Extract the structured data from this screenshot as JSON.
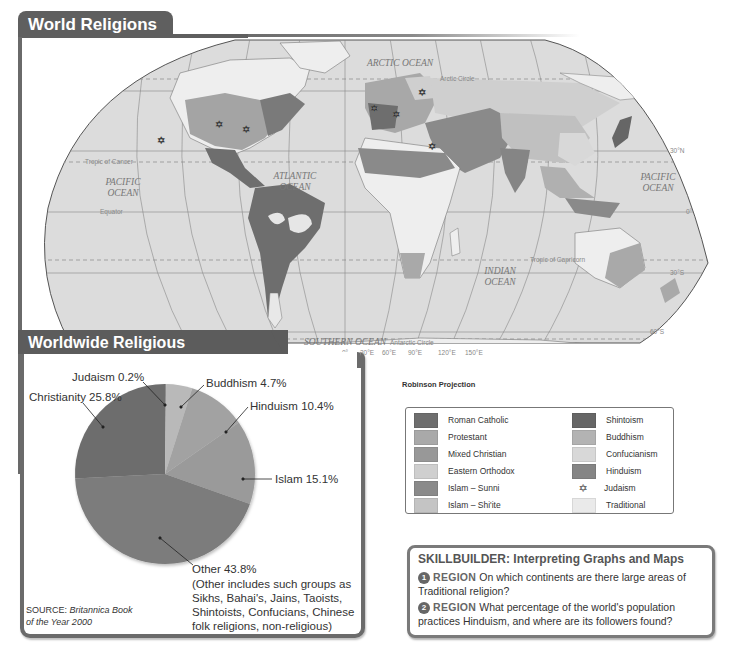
{
  "map": {
    "title": "World Religions",
    "projection": "Robinson Projection",
    "oceans": [
      "ARCTIC OCEAN",
      "PACIFIC OCEAN",
      "ATLANTIC OCEAN",
      "INDIAN OCEAN",
      "PACIFIC OCEAN",
      "SOUTHERN OCEAN"
    ],
    "lines": {
      "arctic_circle": "Arctic Circle",
      "tropic_cancer": "Tropic of Cancer",
      "equator": "Equator",
      "tropic_capricorn": "Tropic of Capricorn",
      "antarctic_circle": "Antarctic Circle"
    },
    "lat_labels": [
      "30°N",
      "0°",
      "30°S",
      "60°S"
    ],
    "lon_labels": [
      "0°",
      "30°E",
      "60°E",
      "90°E",
      "120°E",
      "150°E"
    ]
  },
  "legend": {
    "items": [
      {
        "label": "Roman Catholic",
        "color": "#6e6e6e"
      },
      {
        "label": "Protestant",
        "color": "#a9a9a9"
      },
      {
        "label": "Mixed Christian",
        "color": "#989898"
      },
      {
        "label": "Eastern Orthodox",
        "color": "#cfcfcf"
      },
      {
        "label": "Islam – Sunni",
        "color": "#8a8a8a"
      },
      {
        "label": "Islam – Shi'ite",
        "color": "#c4c4c4"
      },
      {
        "label": "Shintoism",
        "color": "#666666"
      },
      {
        "label": "Buddhism",
        "color": "#b3b3b3"
      },
      {
        "label": "Confucianism",
        "color": "#d8d8d8"
      },
      {
        "label": "Hinduism",
        "color": "#858585"
      },
      {
        "label": "Judaism",
        "symbol": "✡"
      },
      {
        "label": "Traditional",
        "color": "#eaeaea"
      }
    ]
  },
  "pie": {
    "title": "Worldwide Religious Membership",
    "labels": {
      "judaism": "Judaism 0.2%",
      "buddhism": "Buddhism 4.7%",
      "christianity": "Christianity 25.8%",
      "hinduism": "Hinduism 10.4%",
      "islam": "Islam 15.1%",
      "other": "Other 43.8%"
    },
    "other_note": [
      "(Other includes such groups as",
      "Sikhs, Bahai's, Jains, Taoists,",
      "Shintoists, Confucians, Chinese",
      "folk religions, non-religious)"
    ],
    "source_prefix": "SOURCE: ",
    "source_title_1": "Britannica Book",
    "source_title_2": "of the Year 2000"
  },
  "skillbuilder": {
    "title": "SKILLBUILDER: Interpreting Graphs and Maps",
    "questions": [
      {
        "num": "1",
        "tag": "REGION",
        "text": "On which continents are there large areas of Traditional religion?"
      },
      {
        "num": "2",
        "tag": "REGION",
        "text": "What percentage of the world's population practices Hinduism, and where are its followers found?"
      }
    ]
  },
  "chart_data": {
    "type": "pie",
    "title": "Worldwide Religious Membership",
    "categories": [
      "Judaism",
      "Buddhism",
      "Hinduism",
      "Islam",
      "Other",
      "Christianity"
    ],
    "values": [
      0.2,
      4.7,
      10.4,
      15.1,
      43.8,
      25.8
    ],
    "unit": "%",
    "colors": [
      "#8c8c8c",
      "#b9b9b9",
      "#a2a2a2",
      "#9a9a9a",
      "#7b7b7b",
      "#6d6d6d"
    ],
    "start_angle": "12 o'clock, clockwise",
    "legend": "none (direct labels with leader lines)",
    "source": "Britannica Book of the Year 2000"
  }
}
